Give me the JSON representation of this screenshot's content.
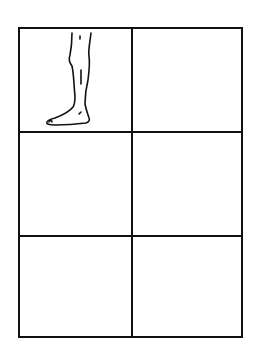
{
  "diagram": {
    "type": "grid",
    "rows": 3,
    "columns": 2,
    "line_color": "#111111",
    "background": "#ffffff",
    "cells": [
      {
        "row": 1,
        "col": 1,
        "content": "leg-and-foot-drawing"
      },
      {
        "row": 1,
        "col": 2,
        "content": ""
      },
      {
        "row": 2,
        "col": 1,
        "content": ""
      },
      {
        "row": 2,
        "col": 2,
        "content": ""
      },
      {
        "row": 3,
        "col": 1,
        "content": ""
      },
      {
        "row": 3,
        "col": 2,
        "content": ""
      }
    ],
    "illustration": {
      "icon": "leg-foot-icon",
      "description": "Line drawing of a lower leg and foot, facing left"
    }
  }
}
